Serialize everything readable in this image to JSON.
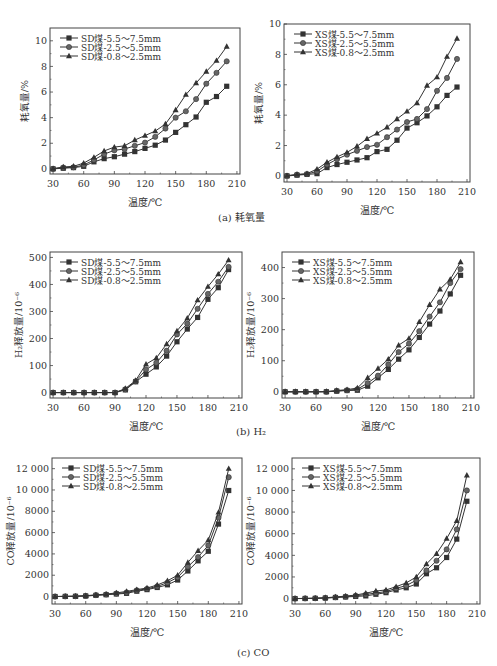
{
  "captions": {
    "a": "(a) 耗氧量",
    "b": "(b) H₂",
    "c": "(c) CO"
  },
  "style": {
    "series_color": "#333333",
    "axis_color": "#444444",
    "markers": [
      "square",
      "circle",
      "triangle"
    ]
  },
  "chart_data": [
    {
      "id": "a-sd",
      "type": "line",
      "title": "",
      "xlabel": "温度/℃",
      "ylabel": "耗氧量/%",
      "xlim": [
        27,
        213
      ],
      "ylim": [
        -0.4,
        11
      ],
      "xticks": [
        30,
        60,
        90,
        120,
        150,
        180,
        210
      ],
      "yticks": [
        0,
        2,
        4,
        6,
        8,
        10
      ],
      "ytick_labels": [
        "0",
        "2",
        "4",
        "6",
        "8",
        "10"
      ],
      "legend_position": "upper-left",
      "x": [
        30,
        40,
        50,
        60,
        70,
        80,
        90,
        100,
        110,
        120,
        130,
        140,
        150,
        160,
        170,
        180,
        190,
        200
      ],
      "series": [
        {
          "name": "SD煤-5.5～7.5mm",
          "marker": "square",
          "values": [
            0,
            0.05,
            0.1,
            0.2,
            0.55,
            0.8,
            0.95,
            1.15,
            1.35,
            1.6,
            1.85,
            2.25,
            2.85,
            3.45,
            4.05,
            5.2,
            5.65,
            6.45
          ]
        },
        {
          "name": "SD煤-2.5～5.5mm",
          "marker": "circle",
          "values": [
            0,
            0.1,
            0.12,
            0.3,
            0.7,
            1.15,
            1.45,
            1.55,
            1.8,
            2.05,
            2.5,
            3.15,
            4.0,
            4.5,
            5.45,
            6.65,
            7.5,
            8.4
          ]
        },
        {
          "name": "SD煤-0.8～2.5mm",
          "marker": "triangle",
          "values": [
            0.02,
            0.15,
            0.2,
            0.45,
            0.9,
            1.4,
            1.7,
            1.8,
            2.25,
            2.6,
            2.95,
            3.5,
            4.6,
            5.8,
            6.7,
            7.6,
            8.45,
            9.55
          ]
        }
      ]
    },
    {
      "id": "a-xs",
      "type": "line",
      "title": "",
      "xlabel": "温度/℃",
      "ylabel": "耗氧量/%",
      "xlim": [
        27,
        213
      ],
      "ylim": [
        -0.4,
        10
      ],
      "xticks": [
        30,
        60,
        90,
        120,
        150,
        180,
        210
      ],
      "yticks": [
        0,
        2,
        4,
        6,
        8,
        10
      ],
      "ytick_labels": [
        "0",
        "2",
        "4",
        "6",
        "8",
        "10"
      ],
      "legend_position": "upper-left",
      "x": [
        30,
        40,
        50,
        60,
        70,
        80,
        90,
        100,
        110,
        120,
        130,
        140,
        150,
        160,
        170,
        180,
        190,
        200
      ],
      "series": [
        {
          "name": "XS煤-5.5～7.5mm",
          "marker": "square",
          "values": [
            0,
            0.05,
            0.1,
            0.15,
            0.55,
            0.75,
            0.9,
            1.05,
            1.2,
            1.6,
            1.75,
            2.35,
            3.15,
            3.5,
            3.95,
            4.55,
            5.3,
            5.85
          ]
        },
        {
          "name": "XS煤-2.5～5.5mm",
          "marker": "circle",
          "values": [
            0,
            0.08,
            0.12,
            0.3,
            0.75,
            1.1,
            1.4,
            1.65,
            1.9,
            2.05,
            2.55,
            3.05,
            3.55,
            3.75,
            4.4,
            5.6,
            6.45,
            7.7
          ]
        },
        {
          "name": "XS煤-0.8～2.5mm",
          "marker": "triangle",
          "values": [
            0.02,
            0.1,
            0.15,
            0.45,
            0.9,
            1.25,
            1.55,
            1.95,
            2.45,
            2.8,
            3.2,
            3.75,
            4.25,
            4.8,
            5.95,
            6.5,
            7.85,
            9.05
          ]
        }
      ]
    },
    {
      "id": "b-sd",
      "type": "line",
      "title": "",
      "xlabel": "温度/℃",
      "ylabel": "H₂释放量/10⁻⁶",
      "xlim": [
        27,
        213
      ],
      "ylim": [
        -20,
        520
      ],
      "xticks": [
        30,
        60,
        90,
        120,
        150,
        180,
        210
      ],
      "yticks": [
        0,
        100,
        200,
        300,
        400,
        500
      ],
      "ytick_labels": [
        "0",
        "100",
        "200",
        "300",
        "400",
        "500"
      ],
      "legend_position": "upper-left",
      "x": [
        30,
        40,
        50,
        60,
        70,
        80,
        90,
        100,
        110,
        120,
        130,
        140,
        150,
        160,
        170,
        180,
        190,
        200
      ],
      "series": [
        {
          "name": "SD煤-5.5～7.5mm",
          "marker": "square",
          "values": [
            0,
            0,
            0,
            0,
            0,
            0,
            0,
            10,
            40,
            68,
            95,
            135,
            188,
            235,
            278,
            345,
            388,
            455
          ]
        },
        {
          "name": "SD煤-2.5～5.5mm",
          "marker": "circle",
          "values": [
            0,
            0,
            0,
            0,
            0,
            0,
            0,
            12,
            42,
            85,
            110,
            155,
            215,
            255,
            310,
            365,
            410,
            465
          ]
        },
        {
          "name": "SD煤-0.8～2.5mm",
          "marker": "triangle",
          "values": [
            0,
            0,
            0,
            0,
            0,
            0,
            0,
            15,
            45,
            105,
            128,
            180,
            228,
            275,
            342,
            392,
            438,
            490
          ]
        }
      ]
    },
    {
      "id": "b-xs",
      "type": "line",
      "title": "",
      "xlabel": "温度/℃",
      "ylabel": "H₂释放量/10⁻⁶",
      "xlim": [
        27,
        213
      ],
      "ylim": [
        -20,
        450
      ],
      "xticks": [
        30,
        60,
        90,
        120,
        150,
        180,
        210
      ],
      "yticks": [
        0,
        100,
        200,
        300,
        400
      ],
      "ytick_labels": [
        "0",
        "100",
        "200",
        "300",
        "400"
      ],
      "legend_position": "upper-left",
      "x": [
        30,
        40,
        50,
        60,
        70,
        80,
        90,
        100,
        110,
        120,
        130,
        140,
        150,
        160,
        170,
        180,
        190,
        200
      ],
      "series": [
        {
          "name": "XS煤-5.5～7.5mm",
          "marker": "square",
          "values": [
            0,
            0,
            0,
            0,
            0,
            2,
            4,
            5,
            18,
            45,
            72,
            105,
            135,
            175,
            218,
            260,
            315,
            375
          ]
        },
        {
          "name": "XS煤-2.5～5.5mm",
          "marker": "circle",
          "values": [
            0,
            0,
            0,
            0,
            0,
            3,
            5,
            8,
            28,
            52,
            88,
            128,
            155,
            195,
            242,
            288,
            350,
            395
          ]
        },
        {
          "name": "XS煤-0.8～2.5mm",
          "marker": "triangle",
          "values": [
            0,
            0,
            0,
            0,
            1,
            4,
            7,
            12,
            45,
            75,
            105,
            150,
            172,
            225,
            280,
            330,
            362,
            418
          ]
        }
      ]
    },
    {
      "id": "c-sd",
      "type": "line",
      "title": "",
      "xlabel": "温度/℃",
      "ylabel": "CO释放量/10⁻⁶",
      "xlim": [
        27,
        213
      ],
      "ylim": [
        -700,
        13000
      ],
      "xticks": [
        30,
        60,
        90,
        120,
        150,
        180,
        210
      ],
      "yticks": [
        0,
        2000,
        4000,
        6000,
        8000,
        10000,
        12000
      ],
      "ytick_labels": [
        "0",
        "2000",
        "4000",
        "6000",
        "8000",
        "10 000",
        "12 000"
      ],
      "legend_position": "upper-left",
      "x": [
        30,
        40,
        50,
        60,
        70,
        80,
        90,
        100,
        110,
        120,
        130,
        140,
        150,
        160,
        170,
        180,
        190,
        200
      ],
      "series": [
        {
          "name": "SD煤-5.5～7.5mm",
          "marker": "square",
          "values": [
            0,
            10,
            20,
            50,
            110,
            170,
            240,
            300,
            500,
            650,
            850,
            1100,
            1550,
            2400,
            3350,
            4250,
            6800,
            9950
          ]
        },
        {
          "name": "SD煤-2.5～5.5mm",
          "marker": "circle",
          "values": [
            0,
            15,
            25,
            60,
            130,
            190,
            280,
            380,
            580,
            720,
            950,
            1300,
            1800,
            2800,
            3700,
            4800,
            7400,
            11200
          ]
        },
        {
          "name": "SD煤-0.8～2.5mm",
          "marker": "triangle",
          "values": [
            5,
            20,
            35,
            80,
            160,
            230,
            340,
            480,
            650,
            800,
            1080,
            1480,
            2000,
            3200,
            4300,
            5300,
            7900,
            12000
          ]
        }
      ]
    },
    {
      "id": "c-xs",
      "type": "line",
      "title": "",
      "xlabel": "温度/℃",
      "ylabel": "CO释放量/10⁻⁶",
      "xlim": [
        27,
        213
      ],
      "ylim": [
        -500,
        13000
      ],
      "xticks": [
        30,
        60,
        90,
        120,
        150,
        180,
        210
      ],
      "yticks": [
        0,
        2000,
        4000,
        6000,
        8000,
        10000,
        12000
      ],
      "ytick_labels": [
        "0",
        "2000",
        "4000",
        "6000",
        "8000",
        "10 000",
        "12 000"
      ],
      "legend_position": "upper-left",
      "x": [
        30,
        40,
        50,
        60,
        70,
        80,
        90,
        100,
        110,
        120,
        130,
        140,
        150,
        160,
        170,
        180,
        190,
        200
      ],
      "series": [
        {
          "name": "XS煤-5.5～7.5mm",
          "marker": "square",
          "values": [
            0,
            10,
            20,
            50,
            100,
            150,
            200,
            250,
            400,
            550,
            800,
            1000,
            1350,
            2300,
            2850,
            3800,
            5500,
            9000
          ]
        },
        {
          "name": "XS煤-2.5～5.5mm",
          "marker": "circle",
          "values": [
            0,
            15,
            30,
            60,
            120,
            180,
            260,
            380,
            520,
            650,
            950,
            1200,
            1700,
            2600,
            3500,
            4550,
            6400,
            10000
          ]
        },
        {
          "name": "XS煤-0.8～2.5mm",
          "marker": "triangle",
          "values": [
            5,
            20,
            40,
            80,
            150,
            230,
            330,
            500,
            700,
            800,
            1100,
            1450,
            2000,
            3200,
            4150,
            5550,
            7200,
            11400
          ]
        }
      ]
    }
  ]
}
